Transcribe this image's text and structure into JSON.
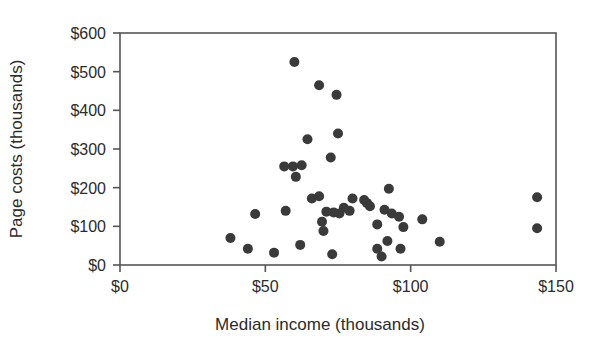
{
  "chart_data": {
    "type": "scatter",
    "title": "",
    "xlabel": "Median income (thousands)",
    "ylabel": "Page costs (thousands)",
    "xlim": [
      0,
      150
    ],
    "ylim": [
      0,
      600
    ],
    "xticks": [
      0,
      50,
      100,
      150
    ],
    "yticks": [
      0,
      100,
      200,
      300,
      400,
      500,
      600
    ],
    "xtick_labels": [
      "$0",
      "$50",
      "$100",
      "$150"
    ],
    "ytick_labels": [
      "$0",
      "$100",
      "$200",
      "$300",
      "$400",
      "$500",
      "$600"
    ],
    "grid": false,
    "legend": null,
    "marker_color": "#3a3a3a",
    "marker_size": 5,
    "frame_color": "#555555",
    "points": [
      {
        "x": 60,
        "y": 525
      },
      {
        "x": 68.5,
        "y": 465
      },
      {
        "x": 74.5,
        "y": 440
      },
      {
        "x": 75,
        "y": 340
      },
      {
        "x": 64.5,
        "y": 325
      },
      {
        "x": 72.5,
        "y": 278
      },
      {
        "x": 56.5,
        "y": 255
      },
      {
        "x": 59.5,
        "y": 255
      },
      {
        "x": 62.5,
        "y": 258
      },
      {
        "x": 60.5,
        "y": 228
      },
      {
        "x": 92.5,
        "y": 197
      },
      {
        "x": 143.5,
        "y": 175
      },
      {
        "x": 66,
        "y": 172
      },
      {
        "x": 68.5,
        "y": 178
      },
      {
        "x": 80,
        "y": 172
      },
      {
        "x": 84,
        "y": 168
      },
      {
        "x": 85,
        "y": 160
      },
      {
        "x": 86,
        "y": 152
      },
      {
        "x": 77,
        "y": 148
      },
      {
        "x": 79,
        "y": 140
      },
      {
        "x": 75.5,
        "y": 133
      },
      {
        "x": 73.5,
        "y": 136
      },
      {
        "x": 71,
        "y": 138
      },
      {
        "x": 91,
        "y": 143
      },
      {
        "x": 93.5,
        "y": 133
      },
      {
        "x": 96,
        "y": 125
      },
      {
        "x": 104,
        "y": 118
      },
      {
        "x": 88.5,
        "y": 105
      },
      {
        "x": 46.5,
        "y": 132
      },
      {
        "x": 57,
        "y": 140
      },
      {
        "x": 69.5,
        "y": 112
      },
      {
        "x": 70,
        "y": 88
      },
      {
        "x": 97.5,
        "y": 98
      },
      {
        "x": 143.5,
        "y": 95
      },
      {
        "x": 38,
        "y": 70
      },
      {
        "x": 44,
        "y": 42
      },
      {
        "x": 53,
        "y": 32
      },
      {
        "x": 62,
        "y": 52
      },
      {
        "x": 73,
        "y": 28
      },
      {
        "x": 88.5,
        "y": 42
      },
      {
        "x": 92,
        "y": 62
      },
      {
        "x": 96.5,
        "y": 42
      },
      {
        "x": 90,
        "y": 22
      },
      {
        "x": 110,
        "y": 60
      }
    ]
  }
}
